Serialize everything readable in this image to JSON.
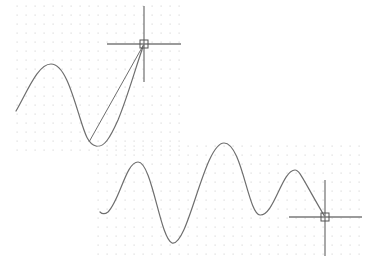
{
  "canvas": {
    "width": 377,
    "height": 271,
    "background": "#ffffff"
  },
  "colors": {
    "grid_dot": "#d9d9d9",
    "curve": "#6e6e6e",
    "crosshair": "#7a7a7a",
    "pickbox": "#555555"
  },
  "panels": [
    {
      "name": "before-panel",
      "grid": {
        "x0": 17,
        "y0": 6,
        "x1": 183,
        "y1": 150,
        "spacing": 9
      },
      "spline_path": "M16,111 C28,90 38,64 51,64 C64,64 72,92 80,118 C85,134 88,144 96,146 C104,148 110,138 118,120 C128,96 136,66 144,44",
      "rubber_band": {
        "x1": 89,
        "y1": 142,
        "x2": 144,
        "y2": 44
      },
      "crosshair": {
        "cx": 144,
        "cy": 44,
        "left": 107,
        "right": 181,
        "top": 6,
        "bottom": 82,
        "box": 8
      }
    },
    {
      "name": "after-panel",
      "grid": {
        "x0": 98,
        "y0": 146,
        "x1": 366,
        "y1": 258,
        "spacing": 9
      },
      "spline_path": "M100,212 C102,214 104,215 108,212 C120,200 126,162 138,162 C152,162 160,238 172,243 C188,248 204,143 224,143 C242,143 248,214 260,215 C274,216 282,170 295,170 C300,170 303,180 325,217",
      "rubber_band": null,
      "crosshair": {
        "cx": 325,
        "cy": 217,
        "left": 289,
        "right": 362,
        "top": 180,
        "bottom": 256,
        "box": 8
      }
    }
  ]
}
